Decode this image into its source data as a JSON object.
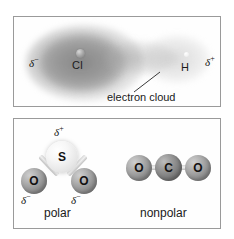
{
  "figure": {
    "panels": [
      {
        "id": "hcl-electron-cloud",
        "caption": "electron cloud",
        "atoms": [
          {
            "symbol": "Cl",
            "charge": "δ",
            "charge_sign": "−"
          },
          {
            "symbol": "H",
            "charge": "δ",
            "charge_sign": "+"
          }
        ]
      },
      {
        "id": "polar-nonpolar",
        "molecules": [
          {
            "name": "polar",
            "formula": "SO2",
            "atoms": [
              {
                "symbol": "S",
                "charge": "δ",
                "charge_sign": "+"
              },
              {
                "symbol": "O",
                "charge": "δ",
                "charge_sign": "−"
              },
              {
                "symbol": "O",
                "charge": "δ",
                "charge_sign": "−"
              }
            ]
          },
          {
            "name": "nonpolar",
            "formula": "CO2",
            "atoms": [
              {
                "symbol": "O",
                "charge": "",
                "charge_sign": ""
              },
              {
                "symbol": "C",
                "charge": "",
                "charge_sign": ""
              },
              {
                "symbol": "O",
                "charge": "",
                "charge_sign": ""
              }
            ]
          }
        ]
      }
    ]
  },
  "top_panel": {
    "delta_negative": {
      "symbol": "δ",
      "sign": "−"
    },
    "delta_positive": {
      "symbol": "δ",
      "sign": "+"
    },
    "chlorine_label": "Cl",
    "hydrogen_label": "H",
    "cloud_caption": "electron cloud"
  },
  "bottom_panel": {
    "polar": {
      "label": "polar",
      "sulfur_label": "S",
      "oxygen_left_label": "O",
      "oxygen_right_label": "O",
      "delta_sulfur": {
        "symbol": "δ",
        "sign": "+"
      },
      "delta_oxygen_left": {
        "symbol": "δ",
        "sign": "−"
      },
      "delta_oxygen_right": {
        "symbol": "δ",
        "sign": "−"
      }
    },
    "nonpolar": {
      "label": "nonpolar",
      "oxygen_left_label": "O",
      "carbon_label": "C",
      "oxygen_right_label": "O"
    }
  },
  "colors": {
    "background": "#ffffff",
    "panel_border": "#9a9a9a",
    "panel_fill": "#fefefe",
    "text": "#1a1a1a",
    "oxygen_sphere": "#8f8f8f",
    "carbon_sphere": "#7b7b7b",
    "sulfur_sphere": "#f2f2f2",
    "electron_cloud": "#8c8c8c",
    "bond": "#dcdcdc"
  }
}
